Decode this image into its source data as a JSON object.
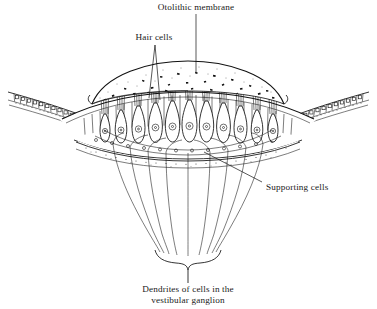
{
  "figure": {
    "background_color": "#ffffff",
    "ink_color": "#111111",
    "width": 377,
    "height": 309
  },
  "labels": {
    "otolithic_membrane": "Otolithic membrane",
    "hair_cells": "Hair cells",
    "supporting_cells": "Supporting cells",
    "dendrites_line1": "Dendrites of cells in the",
    "dendrites_line2": "vestibular ganglion"
  },
  "structures": {
    "otolithic_membrane": {
      "name": "otolithic-membrane",
      "description": "gelatinous dome with embedded otoconia crystals",
      "otoconia_count": 26
    },
    "hair_cells": {
      "name": "hair-cells",
      "description": "flask-shaped sensory cells with apical hair bundles and round nuclei",
      "count": 12
    },
    "supporting_cells": {
      "name": "supporting-cells",
      "description": "slender columnar cells interleaved between hair cells",
      "count": 23
    },
    "flanking_epithelium": {
      "name": "flanking-epithelium",
      "description": "row of cuboidal epithelial cells curving down on both sides",
      "cells_left": 14,
      "cells_right": 14
    },
    "basement_layer": {
      "name": "basement-membrane-layer",
      "description": "stippled connective tissue layer beneath the sensory epithelium"
    },
    "nerve_fibers": {
      "name": "nerve-fiber-bundle",
      "description": "dendrites converging downward into a brace-shaped bundle",
      "fiber_count": 9
    }
  }
}
